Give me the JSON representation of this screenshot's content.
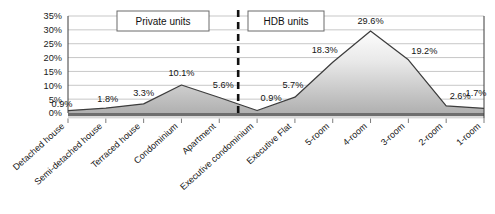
{
  "chart_data": {
    "type": "area",
    "title": "",
    "subtitle": "",
    "xlabel": "",
    "ylabel": "",
    "grid": true,
    "ylim": [
      0,
      35
    ],
    "ytick_labels": [
      "0%",
      "5%",
      "10%",
      "15%",
      "20%",
      "25%",
      "30%",
      "35%"
    ],
    "ytick_values": [
      0,
      5,
      10,
      15,
      20,
      25,
      30,
      35
    ],
    "categories": [
      "Detached house",
      "Semi-detached house",
      "Terraced house",
      "Condominium",
      "Apartment",
      "Executive condominium",
      "Executive Flat",
      "5-room",
      "4-room",
      "3-room",
      "2-room",
      "1-room"
    ],
    "values": [
      0.9,
      1.8,
      3.3,
      10.1,
      5.6,
      0.9,
      5.7,
      18.3,
      29.6,
      19.2,
      2.6,
      1.7
    ],
    "point_labels": [
      "0.9%",
      "1.8%",
      "3.3%",
      "10.1%",
      "5.6%",
      "0.9%",
      "5.7%",
      "18.3%",
      "29.6%",
      "19.2%",
      "2.6%",
      "1.7%"
    ],
    "series": [
      {
        "name": "Share of dwelling units",
        "values": [
          0.9,
          1.8,
          3.3,
          10.1,
          5.6,
          0.9,
          5.7,
          18.3,
          29.6,
          19.2,
          2.6,
          1.7
        ]
      }
    ],
    "annotations": [
      {
        "id": "private",
        "label": "Private units",
        "covers": [
          0,
          5
        ]
      },
      {
        "id": "hdb",
        "label": "HDB units",
        "covers": [
          6,
          11
        ]
      }
    ],
    "divider": {
      "label": "",
      "between": [
        "Apartment",
        "Executive condominium"
      ],
      "style": "dashed-vertical"
    },
    "colors": {
      "line": "#3d3d3d",
      "fill_top": "#fcfcfc",
      "fill_bottom": "#b4b4b4",
      "gridline": "#b9b9b9",
      "axis": "#3a3a3a",
      "divider": "#111111",
      "text": "#151515"
    }
  }
}
